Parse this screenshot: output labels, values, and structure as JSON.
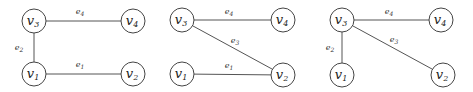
{
  "diagram": {
    "node_radius": 12,
    "panels": [
      {
        "id": "graph-1",
        "nodes": [
          {
            "id": "v3",
            "base": "v",
            "sub": "3",
            "x": 34,
            "y": 21
          },
          {
            "id": "v4",
            "base": "v",
            "sub": "4",
            "x": 133,
            "y": 21
          },
          {
            "id": "v1",
            "base": "v",
            "sub": "1",
            "x": 34,
            "y": 74
          },
          {
            "id": "v2",
            "base": "v",
            "sub": "2",
            "x": 133,
            "y": 74
          }
        ],
        "edges": [
          {
            "id": "e4",
            "base": "e",
            "sub": "4",
            "from": "v3",
            "to": "v4",
            "lx": 80,
            "ly": 14
          },
          {
            "id": "e2",
            "base": "e",
            "sub": "2",
            "from": "v3",
            "to": "v1",
            "lx": 19,
            "ly": 50
          },
          {
            "id": "e1",
            "base": "e",
            "sub": "1",
            "from": "v1",
            "to": "v2",
            "lx": 80,
            "ly": 67
          }
        ]
      },
      {
        "id": "graph-2",
        "nodes": [
          {
            "id": "v3",
            "base": "v",
            "sub": "3",
            "x": 182,
            "y": 20
          },
          {
            "id": "v4",
            "base": "v",
            "sub": "4",
            "x": 283,
            "y": 20
          },
          {
            "id": "v1",
            "base": "v",
            "sub": "1",
            "x": 182,
            "y": 74
          },
          {
            "id": "v2",
            "base": "v",
            "sub": "2",
            "x": 283,
            "y": 75
          }
        ],
        "edges": [
          {
            "id": "e4",
            "base": "e",
            "sub": "4",
            "from": "v3",
            "to": "v4",
            "lx": 229,
            "ly": 14
          },
          {
            "id": "e3",
            "base": "e",
            "sub": "3",
            "from": "v3",
            "to": "v2",
            "lx": 235,
            "ly": 43
          },
          {
            "id": "e1",
            "base": "e",
            "sub": "1",
            "from": "v1",
            "to": "v2",
            "lx": 229,
            "ly": 68
          }
        ]
      },
      {
        "id": "graph-3",
        "nodes": [
          {
            "id": "v3",
            "base": "v",
            "sub": "3",
            "x": 342,
            "y": 20
          },
          {
            "id": "v4",
            "base": "v",
            "sub": "4",
            "x": 441,
            "y": 20
          },
          {
            "id": "v1",
            "base": "v",
            "sub": "1",
            "x": 342,
            "y": 75
          },
          {
            "id": "v2",
            "base": "v",
            "sub": "2",
            "x": 443,
            "y": 75
          }
        ],
        "edges": [
          {
            "id": "e4",
            "base": "e",
            "sub": "4",
            "from": "v3",
            "to": "v4",
            "lx": 389,
            "ly": 14
          },
          {
            "id": "e2",
            "base": "e",
            "sub": "2",
            "from": "v3",
            "to": "v1",
            "lx": 330,
            "ly": 50
          },
          {
            "id": "e3",
            "base": "e",
            "sub": "3",
            "from": "v3",
            "to": "v2",
            "lx": 394,
            "ly": 42
          }
        ]
      }
    ]
  }
}
